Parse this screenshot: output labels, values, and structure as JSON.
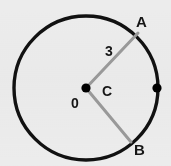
{
  "figure": {
    "kind": "geometry-circle-diagram",
    "width": 171,
    "height": 166,
    "background_color": "#ececec"
  },
  "colors": {
    "circle_stroke": "#111111",
    "radius_stroke": "#9a9a9a",
    "point_fill": "#000000",
    "label_color": "#161616"
  },
  "circle": {
    "center_x": 86,
    "center_y": 88,
    "radius": 72,
    "stroke_width": 3.4
  },
  "points": [
    {
      "id": "center",
      "name": "center-point",
      "x": 86,
      "y": 88,
      "dot_radius": 4.6,
      "labels": [
        "C",
        "0"
      ]
    },
    {
      "id": "right",
      "name": "right-point",
      "x": 157,
      "y": 88,
      "dot_radius": 4.6,
      "labels": []
    }
  ],
  "radii": [
    {
      "id": "radius-a",
      "name": "radius-to-a",
      "from_x": 86,
      "from_y": 88,
      "to_x": 138,
      "to_y": 33,
      "stroke_width": 3.0,
      "length_label": "3"
    },
    {
      "id": "radius-b",
      "name": "radius-to-b",
      "from_x": 86,
      "from_y": 88,
      "to_x": 131,
      "to_y": 142,
      "stroke_width": 3.0,
      "length_label": ""
    }
  ],
  "labels": {
    "point_a": "A",
    "point_b": "B",
    "center_c": "C",
    "center_zero": "0",
    "radius_length": "3"
  }
}
